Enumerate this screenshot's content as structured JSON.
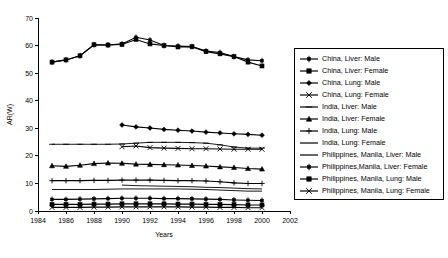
{
  "chart_data": {
    "type": "line",
    "title": "",
    "xlabel": "Years",
    "ylabel": "AR(W)",
    "xlim": [
      1984,
      2002
    ],
    "ylim": [
      0,
      70
    ],
    "xticks": [
      1984,
      1986,
      1988,
      1990,
      1992,
      1994,
      1996,
      1998,
      2000,
      2002
    ],
    "yticks": [
      0,
      10,
      20,
      30,
      40,
      50,
      60,
      70
    ],
    "grid": false,
    "legend_position": "right",
    "series": [
      {
        "name": "China, Liver: Male",
        "marker": "plus-bar",
        "x": [
          1985,
          1986,
          1987,
          1988,
          1989,
          1990,
          1991,
          1992,
          1993,
          1994,
          1995,
          1996,
          1997,
          1998,
          1999,
          2000
        ],
        "values": [
          54.0,
          54.8,
          56.3,
          60.3,
          60.2,
          60.6,
          63.0,
          62.0,
          60.0,
          59.8,
          59.6,
          58.0,
          57.5,
          56.0,
          54.8,
          54.5
        ]
      },
      {
        "name": "China, Liver: Female",
        "marker": "square",
        "x": [
          1985,
          1986,
          1987,
          1988,
          1989,
          1990,
          1991,
          1992,
          1993,
          1994,
          1995,
          1996,
          1997,
          1998,
          1999,
          2000
        ],
        "values": [
          54.0,
          54.8,
          56.3,
          60.3,
          60.2,
          60.4,
          62.2,
          60.6,
          60.0,
          59.5,
          59.6,
          57.8,
          57.0,
          56.0,
          54.0,
          52.6
        ]
      },
      {
        "name": "China, Lung: Male",
        "marker": "diamond",
        "x": [
          1990,
          1991,
          1992,
          1993,
          1994,
          1995,
          1996,
          1997,
          1998,
          1999,
          2000
        ],
        "values": [
          31.2,
          30.5,
          30.1,
          29.6,
          29.3,
          29.0,
          28.6,
          28.3,
          28.0,
          27.8,
          27.5
        ]
      },
      {
        "name": "China, Lung: Female",
        "marker": "cross",
        "x": [
          1990,
          1991,
          1992,
          1993,
          1994,
          1995,
          1996,
          1997,
          1998,
          1999,
          2000
        ],
        "values": [
          23.3,
          23.6,
          23.0,
          22.8,
          22.7,
          22.6,
          22.6,
          22.5,
          22.4,
          22.4,
          22.4
        ]
      },
      {
        "name": "India, Liver: Male",
        "marker": "dash",
        "x": [
          1985,
          1986,
          1987,
          1988,
          1989,
          1990,
          1991,
          1992,
          1993,
          1994,
          1995,
          1996,
          1997,
          1998,
          1999,
          2000
        ],
        "values": [
          24.2,
          24.2,
          24.2,
          24.2,
          24.2,
          24.3,
          24.6,
          24.9,
          24.9,
          24.9,
          24.8,
          24.6,
          24.0,
          23.2,
          22.8,
          22.8
        ]
      },
      {
        "name": "India, Liver: Female",
        "marker": "triangle",
        "x": [
          1985,
          1986,
          1987,
          1988,
          1989,
          1990,
          1991,
          1992,
          1993,
          1994,
          1995,
          1996,
          1997,
          1998,
          1999,
          2000
        ],
        "values": [
          16.4,
          16.2,
          16.6,
          17.2,
          17.4,
          17.3,
          17.0,
          16.9,
          16.8,
          16.7,
          16.5,
          16.3,
          16.0,
          15.8,
          15.4,
          15.2
        ]
      },
      {
        "name": "India, Lung: Male",
        "marker": "plus",
        "x": [
          1985,
          1986,
          1987,
          1988,
          1989,
          1990,
          1991,
          1992,
          1993,
          1994,
          1995,
          1996,
          1997,
          1998,
          1999,
          2000
        ],
        "values": [
          11.0,
          11.0,
          11.0,
          11.1,
          11.1,
          11.2,
          11.2,
          11.2,
          11.1,
          11.0,
          11.0,
          10.9,
          10.6,
          10.2,
          10.0,
          10.0
        ]
      },
      {
        "name": "India, Lung: Female",
        "marker": "line",
        "x": [
          1985,
          1986,
          1987,
          1988,
          1989,
          1990,
          1991,
          1992,
          1993,
          1994,
          1995,
          1996,
          1997,
          1998,
          1999,
          2000
        ],
        "values": [
          7.8,
          7.8,
          7.8,
          7.8,
          7.9,
          8.0,
          8.0,
          8.0,
          8.0,
          8.0,
          7.9,
          7.8,
          7.6,
          7.4,
          7.2,
          7.2
        ]
      },
      {
        "name": "Philippines, Manila, Liver: Male",
        "marker": "line",
        "x": [
          1990,
          1991,
          1992,
          1993,
          1994,
          1995,
          1996,
          1997,
          1998,
          1999,
          2000
        ],
        "values": [
          9.4,
          9.2,
          9.1,
          9.0,
          8.9,
          8.8,
          8.6,
          8.5,
          8.3,
          8.1,
          8.0
        ]
      },
      {
        "name": "Philippines,Manila, Liver: Female",
        "marker": "plus-bar",
        "x": [
          1985,
          1986,
          1987,
          1988,
          1989,
          1990,
          1991,
          1992,
          1993,
          1994,
          1995,
          1996,
          1997,
          1998,
          1999,
          2000
        ],
        "values": [
          4.2,
          4.2,
          4.3,
          4.4,
          4.5,
          4.6,
          4.6,
          4.6,
          4.5,
          4.5,
          4.4,
          4.3,
          4.2,
          4.0,
          3.9,
          3.8
        ]
      },
      {
        "name": "Philippines, Manila, Lung: Male",
        "marker": "square",
        "x": [
          1985,
          1986,
          1987,
          1988,
          1989,
          1990,
          1991,
          1992,
          1993,
          1994,
          1995,
          1996,
          1997,
          1998,
          1999,
          2000
        ],
        "values": [
          2.4,
          2.4,
          2.4,
          2.5,
          2.5,
          2.6,
          2.6,
          2.6,
          2.6,
          2.5,
          2.5,
          2.4,
          2.4,
          2.3,
          2.2,
          2.2
        ]
      },
      {
        "name": "Philippines, Manila, Lung: Female",
        "marker": "cross",
        "x": [
          1985,
          1986,
          1987,
          1988,
          1989,
          1990,
          1991,
          1992,
          1993,
          1994,
          1995,
          1996,
          1997,
          1998,
          1999,
          2000
        ],
        "values": [
          1.3,
          1.3,
          1.3,
          1.4,
          1.4,
          1.5,
          1.5,
          1.5,
          1.5,
          1.5,
          1.4,
          1.4,
          1.3,
          1.3,
          1.2,
          1.2
        ]
      }
    ]
  },
  "legend": {
    "items": [
      {
        "label": "China, Liver: Male",
        "marker": "plus-bar"
      },
      {
        "label": "China, Liver: Female",
        "marker": "square"
      },
      {
        "label": "China, Lung: Male",
        "marker": "diamond"
      },
      {
        "label": "China, Lung: Female",
        "marker": "cross"
      },
      {
        "label": "India, Liver: Male",
        "marker": "dash"
      },
      {
        "label": "India, Liver: Female",
        "marker": "triangle"
      },
      {
        "label": "India, Lung: Male",
        "marker": "plus"
      },
      {
        "label": "India, Lung: Female",
        "marker": "line"
      },
      {
        "label": "Philippines, Manila, Liver: Male",
        "marker": "line"
      },
      {
        "label": "Philippines,Manila, Liver: Female",
        "marker": "plus-bar"
      },
      {
        "label": "Philippines, Manila, Lung: Male",
        "marker": "square"
      },
      {
        "label": "Philippines, Manila, Lung: Female",
        "marker": "cross"
      }
    ]
  },
  "colors": {
    "series": "#000000",
    "axis": "#000000",
    "background": "#ffffff"
  }
}
